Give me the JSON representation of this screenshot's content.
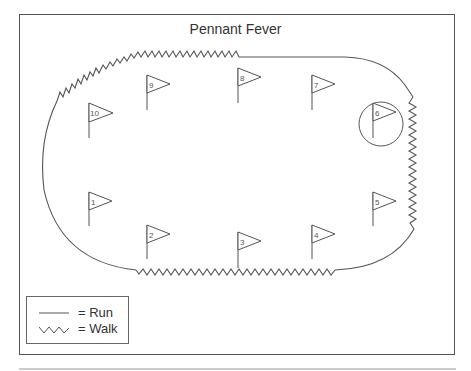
{
  "title": "Pennant Fever",
  "legend": {
    "run_label": "= Run",
    "walk_label": "= Walk"
  },
  "colors": {
    "stroke": "#555555",
    "background": "#ffffff"
  },
  "flags": [
    {
      "number": "1",
      "x": 89,
      "y": 192,
      "pole_bottom": 226
    },
    {
      "number": "2",
      "x": 147,
      "y": 225,
      "pole_bottom": 259
    },
    {
      "number": "3",
      "x": 238,
      "y": 232,
      "pole_bottom": 268
    },
    {
      "number": "4",
      "x": 312,
      "y": 225,
      "pole_bottom": 259
    },
    {
      "number": "5",
      "x": 373,
      "y": 192,
      "pole_bottom": 226
    },
    {
      "number": "6",
      "x": 373,
      "y": 103,
      "pole_bottom": 138,
      "circled": true
    },
    {
      "number": "7",
      "x": 312,
      "y": 75,
      "pole_bottom": 110
    },
    {
      "number": "8",
      "x": 238,
      "y": 68,
      "pole_bottom": 103
    },
    {
      "number": "9",
      "x": 147,
      "y": 75,
      "pole_bottom": 110
    },
    {
      "number": "10",
      "x": 89,
      "y": 103,
      "pole_bottom": 138
    }
  ],
  "track_segments": [
    {
      "type": "walk",
      "from": "left-top",
      "to": "top-middle"
    },
    {
      "type": "run",
      "from": "top-middle",
      "to": "right-top"
    },
    {
      "type": "walk",
      "from": "right-top",
      "to": "right-bottom"
    },
    {
      "type": "run",
      "from": "right-bottom",
      "to": "bottom-right"
    },
    {
      "type": "walk",
      "from": "bottom-right",
      "to": "bottom-left"
    },
    {
      "type": "run",
      "from": "bottom-left",
      "to": "left-top"
    }
  ]
}
